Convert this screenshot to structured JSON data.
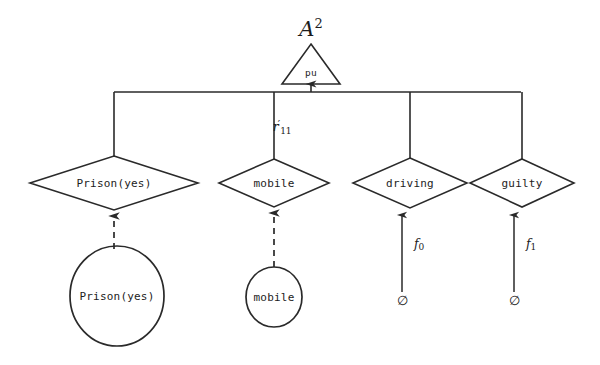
{
  "diagram": {
    "title": {
      "base": "A",
      "exponent": "2",
      "full": "A²"
    },
    "root": {
      "shape": "triangle",
      "label": "pu",
      "cx": 311,
      "cy": 70
    },
    "bus": {
      "y": 92,
      "x_left": 114,
      "x_right": 521,
      "arrow_x": 311
    },
    "edge_label": {
      "base": "r",
      "prime": "′",
      "subscript": "11",
      "full": "r′11",
      "x": 282,
      "y": 127
    },
    "diamonds": [
      {
        "label": "Prison(yes)",
        "cx": 114,
        "cy": 183,
        "rx": 84,
        "ry": 27
      },
      {
        "label": "mobile",
        "cx": 274,
        "cy": 183,
        "rx": 55,
        "ry": 24
      },
      {
        "label": "driving",
        "cx": 410,
        "cy": 183,
        "rx": 57,
        "ry": 25
      },
      {
        "label": "guilty",
        "cx": 522,
        "cy": 183,
        "rx": 52,
        "ry": 24
      }
    ],
    "circles": [
      {
        "label": "Prison(yes)",
        "cx": 117,
        "cy": 296,
        "rx": 47,
        "ry": 50,
        "edge_style": "dashed"
      },
      {
        "label": "mobile",
        "cx": 274,
        "cy": 297,
        "rx": 28,
        "ry": 30,
        "edge_style": "dashed"
      }
    ],
    "leaves": [
      {
        "symbol": "∅",
        "cx": 402,
        "cy": 300,
        "edge_label_base": "f",
        "edge_label_sub": "0",
        "edge_label_full": "f₀",
        "edge_label_x": 419,
        "edge_label_y": 244,
        "edge_style": "solid"
      },
      {
        "symbol": "∅",
        "cx": 514,
        "cy": 300,
        "edge_label_base": "f",
        "edge_label_sub": "1",
        "edge_label_full": "f₁",
        "edge_label_x": 531,
        "edge_label_y": 244,
        "edge_style": "solid"
      }
    ],
    "colors": {
      "stroke": "#2a2a2a",
      "text": "#1c1c1c",
      "background": "#ffffff"
    }
  }
}
